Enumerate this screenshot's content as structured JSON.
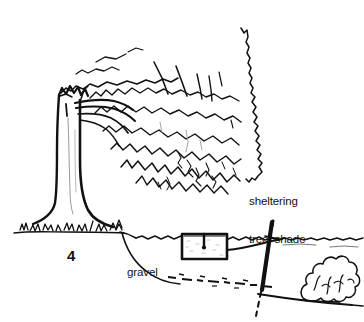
{
  "figure": {
    "name": "livestock-watering-trough-under-sheltering-tree",
    "number": "4",
    "background_color": "#ffffff",
    "ink_color": "#111111",
    "width": 364,
    "height": 322
  },
  "labels": {
    "sheltering_tree_line1": "sheltering",
    "sheltering_tree_line2": "tree, shade",
    "gravel": "gravel",
    "figure_number": "4"
  },
  "elements": {
    "tree": "sheltering-tree",
    "tree_canopy": "drooping-canopy-foliage",
    "tree_trunk": "tree-trunk",
    "grass": "grass-tufts-at-tree-base",
    "ground_line": "ground-surface-line",
    "trough": "water-trough-box",
    "trough_valve": "float-valve-fitting",
    "supply_pipe": "water-supply-pipe",
    "post": "fence-post",
    "post_buried": "buried-post-dashed",
    "gravel_layer": "gravel-bed-dashed-layer",
    "excavation": "excavation-cut-line",
    "subgrade": "subgrade-slope-line",
    "bush": "shrub-bush-right"
  }
}
